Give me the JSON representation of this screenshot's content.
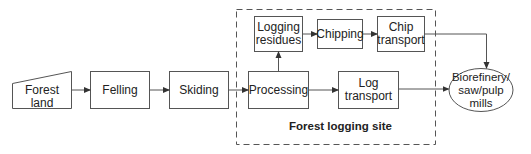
{
  "diagram": {
    "nodes": {
      "forest_land": "Forest land",
      "felling": "Felling",
      "skiding": "Skiding",
      "processing": "Processing",
      "logging_residues": "Logging\nresidues",
      "chipping": "Chipping",
      "chip_transport": "Chip\ntransport",
      "log_transport": "Log\ntransport",
      "biorefinery": "Biorefinery/\nsaw/pulp mills"
    },
    "group_label": "Forest logging site",
    "edges": [
      [
        "forest_land",
        "felling"
      ],
      [
        "felling",
        "skiding"
      ],
      [
        "skiding",
        "processing"
      ],
      [
        "processing",
        "logging_residues"
      ],
      [
        "logging_residues",
        "chipping"
      ],
      [
        "chipping",
        "chip_transport"
      ],
      [
        "chip_transport",
        "biorefinery"
      ],
      [
        "processing",
        "log_transport"
      ],
      [
        "log_transport",
        "biorefinery"
      ]
    ],
    "colors": {
      "stroke": "#555555",
      "text": "#222222",
      "background": "#ffffff"
    }
  }
}
